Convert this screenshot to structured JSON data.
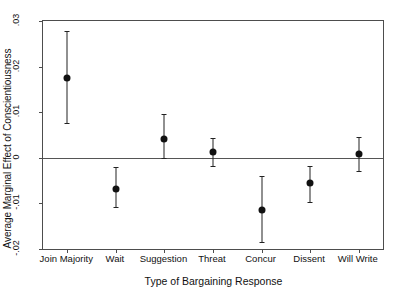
{
  "chart_data": {
    "type": "scatter",
    "title": "",
    "xlabel": "Type of Bargaining Response",
    "ylabel": "Average Marginal Effect of Conscientiousness",
    "categories": [
      "Join Majority",
      "Wait",
      "Suggestion",
      "Threat",
      "Concur",
      "Dissent",
      "Will Write"
    ],
    "values": [
      0.0175,
      -0.0069,
      0.0042,
      0.0012,
      -0.0114,
      -0.0055,
      0.0008
    ],
    "ci_low": [
      0.0076,
      -0.0107,
      5e-05,
      -0.0019,
      -0.0185,
      -0.0097,
      -0.0028
    ],
    "ci_high": [
      0.0279,
      -0.002,
      0.0095,
      0.0043,
      -0.004,
      -0.0019,
      0.0045
    ],
    "ylim": [
      -0.02,
      0.03
    ],
    "yticks": [
      0.03,
      0.02,
      0.01,
      0,
      -0.01,
      -0.02
    ],
    "ytick_labels": [
      ".03",
      ".02",
      ".01",
      "0",
      "-.01",
      "-.02"
    ],
    "grid": false,
    "legend": null,
    "zero_reference_line": 0,
    "marker": "filled-circle",
    "error_bars": "capped-vertical",
    "colors": {
      "marker": "#111111",
      "error_bar": "#222222",
      "axis": "#4d4d4d",
      "zero_line": "#555555",
      "background": "#ffffff",
      "text": "#111111"
    }
  }
}
